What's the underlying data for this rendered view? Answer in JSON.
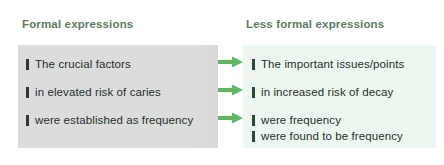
{
  "figure": {
    "accent_arrow_color": "#59b濃"
  },
  "colors": {
    "heading_text": "#5f7a62",
    "left_panel_bg": "#dcdcdc",
    "right_panel_bg": "#eef7ef",
    "left_bullet": "#2f3a33",
    "right_bullet": "#2b4634",
    "body_text": "#23312a",
    "arrow_green": "#5cb85c"
  },
  "columns": {
    "left": {
      "heading": "Formal expressions",
      "items": [
        {
          "bullet": "bar-bullet",
          "text": "The crucial factors"
        },
        {
          "bullet": "bar-bullet",
          "text": "in elevated risk of caries"
        },
        {
          "bullet": "bar-bullet",
          "text": "were established as frequency"
        }
      ]
    },
    "right": {
      "heading": "Less formal expressions",
      "items": [
        {
          "bullet": "bar-bullet",
          "text": "The important issues/points"
        },
        {
          "bullet": "bar-bullet",
          "text": "in increased risk of decay"
        },
        {
          "bullet": "bar-bullet",
          "text": "were frequency"
        },
        {
          "bullet": "bar-bullet",
          "text": "were found to be frequency"
        }
      ]
    }
  },
  "arrows": [
    {
      "icon": "right-arrow-icon",
      "from": "The crucial factors",
      "to": "The important issues/points"
    },
    {
      "icon": "right-arrow-icon",
      "from": "in elevated risk of caries",
      "to": "in increased risk of decay"
    },
    {
      "icon": "right-arrow-icon",
      "from": "were established as frequency",
      "to": "were frequency"
    }
  ]
}
